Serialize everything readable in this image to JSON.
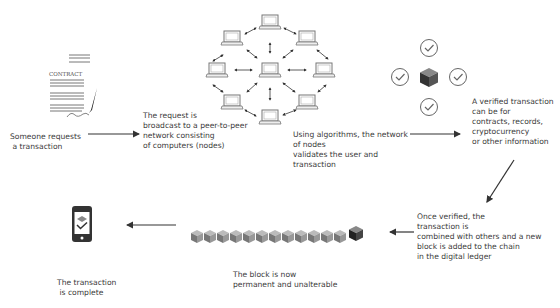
{
  "diagram": {
    "steps": [
      {
        "id": "request",
        "icon": "contract-document-icon",
        "doc_label": "CONTRACT",
        "text": "Someone requests\n a transaction"
      },
      {
        "id": "broadcast",
        "icon": "peer-network-icon",
        "text": "The request is\nbroadcast to a peer-to-peer\nnetwork consisting\nof computers (nodes)"
      },
      {
        "id": "validate",
        "icon": "verified-block-icon",
        "text": "Using algorithms, the network\nof nodes\nvalidates the user and\ntransaction"
      },
      {
        "id": "types",
        "text": "A verified transaction\ncan be for\ncontracts, records,\ncryptocurrency\nor other information"
      },
      {
        "id": "combine",
        "text": "Once verified, the\ntransaction is\ncombined with others and a new\nblock is added to the chain\nin the digital ledger"
      },
      {
        "id": "permanent",
        "icon": "block-chain-icon",
        "text": "The block is now\npermanent and unalterable"
      },
      {
        "id": "complete",
        "icon": "smartphone-check-icon",
        "text": "The transaction\n is complete"
      }
    ],
    "colors": {
      "line": "#333333",
      "icon": "#555555",
      "cube_dark": "#3a3a3a",
      "cube_mid": "#777777",
      "cube_light": "#bbbbbb"
    }
  }
}
